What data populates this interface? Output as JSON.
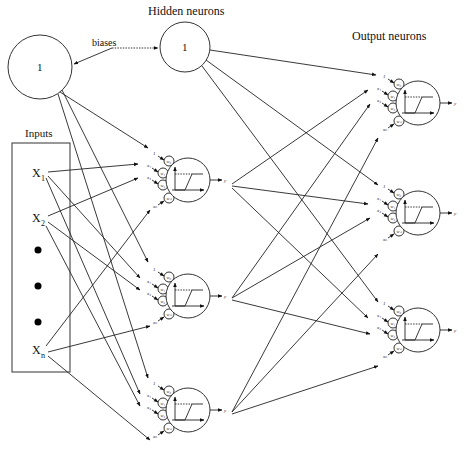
{
  "diagram": {
    "title_hidden": "Hidden neurons",
    "title_output": "Output neurons",
    "biases_label": "biases",
    "inputs_label": "Inputs",
    "input_bias": {
      "label": "1",
      "cx": 40,
      "cy": 67,
      "r": 32
    },
    "hidden_bias": {
      "label": "1",
      "cx": 185,
      "cy": 47,
      "r": 25
    },
    "inputs": [
      {
        "label": "X",
        "sub": "1",
        "x": 32,
        "y": 177
      },
      {
        "label": "X",
        "sub": "2",
        "x": 32,
        "y": 222
      },
      {
        "label": "X",
        "sub": "n",
        "x": 32,
        "y": 354
      }
    ],
    "ellipsis_dots": [
      {
        "cx": 38,
        "cy": 250
      },
      {
        "cx": 38,
        "cy": 286
      },
      {
        "cx": 38,
        "cy": 322
      }
    ],
    "hidden_neurons": [
      {
        "cx": 188,
        "cy": 180,
        "r": 22
      },
      {
        "cx": 188,
        "cy": 296,
        "r": 22
      },
      {
        "cx": 188,
        "cy": 410,
        "r": 22
      }
    ],
    "output_neurons": [
      {
        "cx": 418,
        "cy": 103,
        "r": 22
      },
      {
        "cx": 418,
        "cy": 213,
        "r": 22
      },
      {
        "cx": 418,
        "cy": 330,
        "r": 22
      }
    ],
    "neuron_input_labels": [
      "1",
      "x₁",
      "x₂",
      "xₙ"
    ],
    "weight_labels": [
      "w₀",
      "w₁",
      "w₂",
      "wₙ"
    ],
    "output_label": "y",
    "activation": "ramp/saturating linear"
  }
}
